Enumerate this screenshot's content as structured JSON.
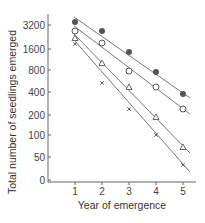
{
  "chart_data": {
    "type": "scatter",
    "title": "",
    "xlabel": "Year of emergence",
    "ylabel": "Total number of seedlings emerged",
    "x": [
      1,
      2,
      3,
      4,
      5
    ],
    "x_ticks": [
      "1",
      "2",
      "3",
      "4",
      "5"
    ],
    "y_scale": "log2 (broken at bottom to 0)",
    "y_ticks": [
      "3200",
      "1600",
      "800",
      "400",
      "200",
      "100",
      "50",
      "0"
    ],
    "grid": false,
    "legend": "none",
    "series": [
      {
        "name": "filled-circle",
        "marker": "filled circle",
        "values": [
          3600,
          2700,
          1250,
          700,
          370
        ],
        "fit_line": true
      },
      {
        "name": "open-circle",
        "marker": "open circle",
        "values": [
          2700,
          1900,
          800,
          480,
          240
        ],
        "fit_line": true
      },
      {
        "name": "open-triangle",
        "marker": "open triangle",
        "values": [
          2200,
          1000,
          480,
          190,
          70
        ],
        "fit_line": true
      },
      {
        "name": "cross",
        "marker": "x",
        "values": [
          1800,
          520,
          240,
          100,
          40
        ],
        "fit_line": true
      }
    ]
  },
  "axes": {
    "x_title": "Year of emergence",
    "y_title": "Total number of seedlings emerged",
    "x_ticks": [
      {
        "label": "1",
        "px": 75
      },
      {
        "label": "2",
        "px": 102
      },
      {
        "label": "3",
        "px": 129
      },
      {
        "label": "4",
        "px": 156
      },
      {
        "label": "5",
        "px": 183
      }
    ],
    "y_ticks": [
      {
        "label": "3200",
        "py": 25
      },
      {
        "label": "1600",
        "py": 49
      },
      {
        "label": "800",
        "py": 70
      },
      {
        "label": "400",
        "py": 92
      },
      {
        "label": "200",
        "py": 115
      },
      {
        "label": "100",
        "py": 135
      },
      {
        "label": "50",
        "py": 157
      },
      {
        "label": "0",
        "py": 180
      }
    ]
  },
  "plot": {
    "series_px": [
      {
        "marker": "filled",
        "points": [
          [
            75,
            22
          ],
          [
            102,
            31
          ],
          [
            129,
            52
          ],
          [
            156,
            72
          ],
          [
            183,
            94
          ]
        ],
        "line": [
          [
            74,
            17
          ],
          [
            190,
            98
          ]
        ]
      },
      {
        "marker": "open",
        "points": [
          [
            75,
            31
          ],
          [
            102,
            43
          ],
          [
            129,
            71
          ],
          [
            156,
            87
          ],
          [
            183,
            109
          ]
        ],
        "line": [
          [
            74,
            26
          ],
          [
            190,
            114
          ]
        ]
      },
      {
        "marker": "triangle",
        "points": [
          [
            75,
            38
          ],
          [
            102,
            63
          ],
          [
            129,
            87
          ],
          [
            156,
            117
          ],
          [
            183,
            147
          ]
        ],
        "line": [
          [
            74,
            34
          ],
          [
            190,
            153
          ]
        ]
      },
      {
        "marker": "cross",
        "points": [
          [
            75,
            44
          ],
          [
            102,
            83
          ],
          [
            129,
            109
          ],
          [
            156,
            135
          ],
          [
            183,
            165
          ]
        ],
        "line": [
          [
            74,
            40
          ],
          [
            190,
            172
          ]
        ]
      }
    ],
    "colors": {
      "line": "#777777",
      "marker_fill": "#555555",
      "axis": "#666666"
    }
  }
}
